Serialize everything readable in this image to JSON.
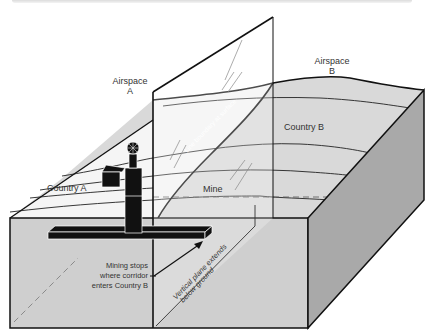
{
  "labels": {
    "airspace_a_line1": "Airspace",
    "airspace_a_line2": "A",
    "airspace_b_line1": "Airspace",
    "airspace_b_line2": "B",
    "country_a": "Country A",
    "country_b": "Country B",
    "mine": "Mine",
    "line_boundary": "Line boundary at surface",
    "vertical_plane_line1": "Vertical plane extends",
    "vertical_plane_line2": "below ground",
    "mining_stops_line1": "Mining stops",
    "mining_stops_line2": "where corridor",
    "mining_stops_line3": "enters Country B"
  },
  "colors": {
    "country_a_surface": "#f3f3f3",
    "country_b_surface": "#d9d9d9",
    "front_face": "#cfcfcf",
    "side_face": "#a9a9a9",
    "outline": "#111111",
    "mine_structure": "#111111"
  }
}
